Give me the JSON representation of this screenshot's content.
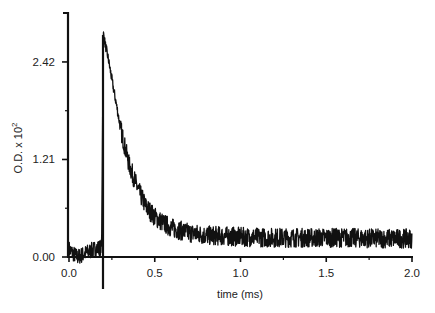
{
  "chart_data": {
    "type": "line",
    "title": "",
    "xlabel": "time (ms)",
    "ylabel": "O.D. x 10",
    "ylabel_superscript": "2",
    "xlim": [
      0.0,
      2.0
    ],
    "ylim": [
      0.0,
      3.05
    ],
    "x_ticks": [
      0.0,
      0.5,
      1.0,
      1.5,
      2.0
    ],
    "x_tick_labels": [
      "0.0",
      "0.5",
      "1.0",
      "1.5",
      "2.0"
    ],
    "x_minor_ticks": [
      0.25,
      0.75,
      1.25,
      1.75
    ],
    "y_ticks": [
      0.0,
      1.21,
      2.42
    ],
    "y_tick_labels": [
      "0.00",
      "1.21",
      "2.42"
    ],
    "y_minor_ticks": [
      0.605,
      1.815
    ],
    "grid": false,
    "legend": null,
    "annotations": [
      {
        "type": "vertical-line",
        "x": 0.2,
        "label": "excitation flash marker"
      }
    ],
    "series": [
      {
        "name": "transient absorption",
        "color": "#111111",
        "noise_amplitude": 0.12,
        "x": [
          0.0,
          0.02,
          0.05,
          0.1,
          0.15,
          0.19,
          0.2,
          0.21,
          0.23,
          0.25,
          0.28,
          0.3,
          0.35,
          0.4,
          0.45,
          0.5,
          0.55,
          0.6,
          0.7,
          0.8,
          0.9,
          1.0,
          1.2,
          1.4,
          1.6,
          1.8,
          2.0
        ],
        "values": [
          0.1,
          0.05,
          0.0,
          0.05,
          0.1,
          0.12,
          2.78,
          2.65,
          2.45,
          2.2,
          1.85,
          1.6,
          1.15,
          0.85,
          0.62,
          0.5,
          0.42,
          0.36,
          0.3,
          0.27,
          0.26,
          0.25,
          0.24,
          0.24,
          0.24,
          0.23,
          0.23
        ]
      }
    ]
  }
}
